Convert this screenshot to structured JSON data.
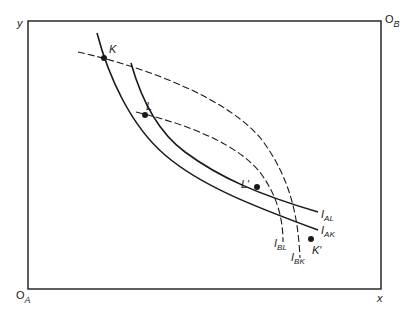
{
  "diagram": {
    "type": "edgeworth-box",
    "colors": {
      "line": "#1a1a1a",
      "background": "#ffffff"
    },
    "axes": {
      "y_label": "y",
      "x_label": "x",
      "origin_A": {
        "main": "O",
        "sub": "A"
      },
      "origin_B": {
        "main": "O",
        "sub": "B"
      }
    },
    "curves": [
      {
        "id": "I_AK",
        "main": "I",
        "sub": "AK",
        "style": "solid"
      },
      {
        "id": "I_AL",
        "main": "I",
        "sub": "AL",
        "style": "solid"
      },
      {
        "id": "I_BK",
        "main": "I",
        "sub": "BK",
        "style": "dashed"
      },
      {
        "id": "I_BL",
        "main": "I",
        "sub": "BL",
        "style": "dashed"
      }
    ],
    "points": [
      {
        "id": "K",
        "label": "K"
      },
      {
        "id": "L",
        "label": "L"
      },
      {
        "id": "L_prime",
        "label": "L′"
      },
      {
        "id": "K_prime",
        "label": "K′"
      }
    ]
  }
}
